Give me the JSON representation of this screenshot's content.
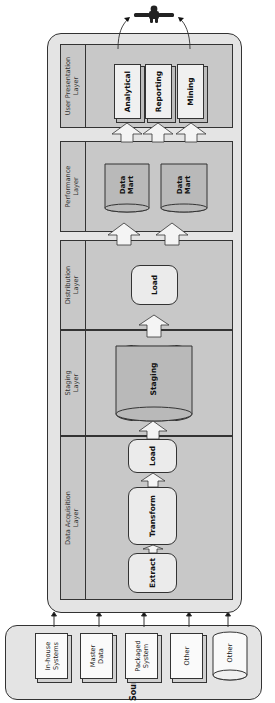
{
  "diagram": {
    "layers": [
      {
        "name": "Data Acquisition",
        "label_line1": "Data Acquisition",
        "label_line2": "Layer",
        "components": [
          "Extract",
          "Transform",
          "Load"
        ]
      },
      {
        "name": "Staging",
        "label_line1": "Staging",
        "label_line2": "Layer",
        "components": [
          "Staging"
        ]
      },
      {
        "name": "Distribution",
        "label_line1": "Distribution",
        "label_line2": "Layer",
        "components": [
          "Load"
        ]
      },
      {
        "name": "Performance",
        "label_line1": "Performance",
        "label_line2": "Layer",
        "components": [
          {
            "line1": "Data",
            "line2": "Mart"
          },
          {
            "line1": "Data",
            "line2": "Mart"
          }
        ]
      },
      {
        "name": "User Presentation",
        "label_line1": "User Presentation",
        "label_line2": "Layer",
        "components": [
          "Analytical",
          "Reporting",
          "Mining"
        ]
      }
    ],
    "sources": {
      "title": "Sources",
      "items": [
        {
          "line1": "In-house",
          "line2": "Systems",
          "shape": "box"
        },
        {
          "line1": "Master",
          "line2": "Data",
          "shape": "box"
        },
        {
          "line1": "Packaged",
          "line2": "System",
          "shape": "box"
        },
        {
          "line1": "Other",
          "line2": "",
          "shape": "box"
        },
        {
          "line1": "Other",
          "line2": "",
          "shape": "cylinder"
        }
      ]
    },
    "end_user": "person-icon",
    "colors": {
      "container": "#e4e4e4",
      "layer": "#c8c8c8",
      "box": "#ebebeb",
      "cylinder": "#b9b9b9",
      "stroke": "#333333"
    }
  }
}
